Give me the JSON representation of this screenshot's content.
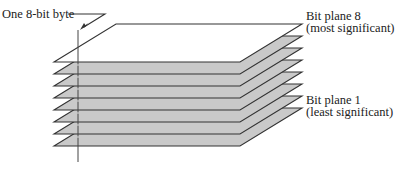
{
  "diagram": {
    "byte_label": "One 8-bit byte",
    "top_label": {
      "line1": "Bit plane 8",
      "line2": "(most significant)"
    },
    "bottom_label": {
      "line1": "Bit plane 1",
      "line2": "(least significant)"
    },
    "plane_count": 8,
    "colors": {
      "top_plane_fill": "#ffffff",
      "lower_plane_fill": "#c9c9c9",
      "line": "#333333",
      "text": "#222222"
    }
  }
}
